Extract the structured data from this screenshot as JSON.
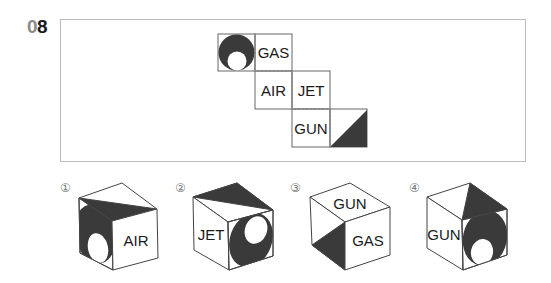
{
  "question": {
    "number_prefix": "0",
    "number_suffix": "8"
  },
  "net": {
    "faces": [
      {
        "id": "circle-face",
        "content": "circle-with-hole"
      },
      {
        "id": "gas-face",
        "label": "GAS"
      },
      {
        "id": "air-face",
        "label": "AIR"
      },
      {
        "id": "jet-face",
        "label": "JET"
      },
      {
        "id": "gun-face",
        "label": "GUN"
      },
      {
        "id": "triangle-face",
        "content": "half-triangle"
      }
    ]
  },
  "options": [
    {
      "marker": "①",
      "right_label": "AIR"
    },
    {
      "marker": "②",
      "left_label": "JET"
    },
    {
      "marker": "③",
      "top_label": "GUN",
      "right_label": "GAS"
    },
    {
      "marker": "④",
      "left_label": "GUN"
    }
  ],
  "colors": {
    "dark": "#3a3a3a",
    "line": "#555555",
    "frame": "#bdbdbd"
  }
}
